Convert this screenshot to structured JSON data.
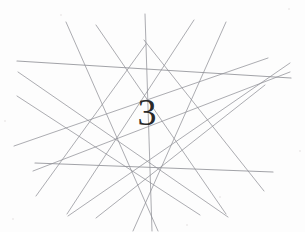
{
  "captcha": {
    "challenge_text": "3",
    "text_color": "#2a2a2a",
    "background_color": "#fdfdfd",
    "line_color": "#8f9096",
    "width": 305,
    "height": 232,
    "text_position": {
      "x": 147,
      "y": 116
    },
    "text_size_px": 38,
    "distortion_lines": [
      {
        "name": "horizontal-upper-long",
        "x1": 17,
        "y1": 61,
        "x2": 291,
        "y2": 78,
        "width": 1.15
      },
      {
        "name": "horizontal-lower-long",
        "x1": 35,
        "y1": 163,
        "x2": 273,
        "y2": 172,
        "width": 1.15
      },
      {
        "name": "diagonal-left-down-a",
        "x1": 18,
        "y1": 72,
        "x2": 228,
        "y2": 217,
        "width": 0.9
      },
      {
        "name": "diagonal-left-down-b",
        "x1": 17,
        "y1": 96,
        "x2": 200,
        "y2": 215,
        "width": 0.9
      },
      {
        "name": "diagonal-left-up-a",
        "x1": 14,
        "y1": 146,
        "x2": 268,
        "y2": 58,
        "width": 0.9
      },
      {
        "name": "diagonal-left-up-b",
        "x1": 33,
        "y1": 171,
        "x2": 290,
        "y2": 72,
        "width": 0.9
      },
      {
        "name": "diagonal-right-down-a",
        "x1": 290,
        "y1": 63,
        "x2": 68,
        "y2": 216,
        "width": 0.9
      },
      {
        "name": "diagonal-right-down-b",
        "x1": 265,
        "y1": 85,
        "x2": 96,
        "y2": 218,
        "width": 0.9
      },
      {
        "name": "steep-left-top-a",
        "x1": 66,
        "y1": 22,
        "x2": 158,
        "y2": 231,
        "width": 0.9
      },
      {
        "name": "steep-left-top-b",
        "x1": 96,
        "y1": 25,
        "x2": 226,
        "y2": 214,
        "width": 0.9
      },
      {
        "name": "steep-right-top-a",
        "x1": 226,
        "y1": 22,
        "x2": 133,
        "y2": 231,
        "width": 0.9
      },
      {
        "name": "steep-right-top-b",
        "x1": 194,
        "y1": 20,
        "x2": 67,
        "y2": 214,
        "width": 0.9
      },
      {
        "name": "vertical-center-a",
        "x1": 145,
        "y1": 14,
        "x2": 152,
        "y2": 231,
        "width": 0.9
      },
      {
        "name": "apex-fan-left",
        "x1": 144,
        "y1": 40,
        "x2": 264,
        "y2": 191,
        "width": 0.9
      },
      {
        "name": "apex-fan-right",
        "x1": 146,
        "y1": 44,
        "x2": 36,
        "y2": 196,
        "width": 0.9
      }
    ],
    "noise_specks": [
      {
        "x": 288,
        "y": 8,
        "d": 2
      },
      {
        "x": 12,
        "y": 218,
        "d": 2
      },
      {
        "x": 219,
        "y": 196,
        "d": 2
      },
      {
        "x": 60,
        "y": 14,
        "d": 2
      },
      {
        "x": 186,
        "y": 224,
        "d": 2
      },
      {
        "x": 299,
        "y": 150,
        "d": 2
      },
      {
        "x": 4,
        "y": 120,
        "d": 2
      }
    ]
  }
}
